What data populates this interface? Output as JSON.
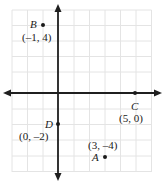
{
  "figure": {
    "type": "coordinate-plane",
    "title": "",
    "axes": {
      "x_axis_label": "",
      "y_axis_label": "",
      "origin_px": [
        58,
        93
      ],
      "unit_px": 15.5,
      "x_range": [
        -3,
        6
      ],
      "y_range": [
        -5,
        5
      ],
      "grid": true,
      "grid_color": "#e2e2e2",
      "axis_color": "#1f1f1f",
      "arrowheads": [
        "left",
        "right",
        "up",
        "down"
      ]
    },
    "points": [
      {
        "id": "point-b",
        "name": "B",
        "coords_label": "(–1, 4)",
        "x": -1,
        "y": 4,
        "dot_px": [
          43,
          25
        ],
        "name_px": [
          30,
          19
        ],
        "coords_px": [
          22,
          32
        ]
      },
      {
        "id": "point-c",
        "name": "C",
        "coords_label": "(5, 0)",
        "x": 5,
        "y": 0,
        "dot_px": [
          135,
          93
        ],
        "name_px": [
          131,
          101
        ],
        "coords_px": [
          119,
          113
        ]
      },
      {
        "id": "point-d",
        "name": "D",
        "coords_label": "(0, –2)",
        "x": 0,
        "y": -2,
        "dot_px": [
          58,
          124
        ],
        "name_px": [
          45,
          119
        ],
        "coords_px": [
          19,
          131
        ]
      },
      {
        "id": "point-a",
        "name": "A",
        "coords_label": "(3, –4)",
        "x": 3,
        "y": -4,
        "dot_px": [
          105,
          157
        ],
        "name_px": [
          92,
          152
        ],
        "coords_px": [
          88,
          140
        ]
      }
    ]
  }
}
